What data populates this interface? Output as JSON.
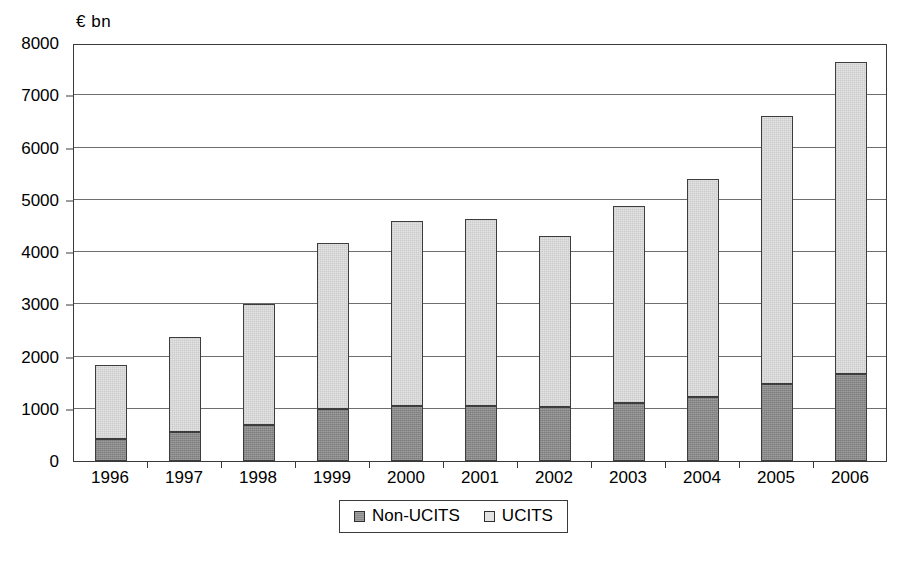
{
  "chart_data": {
    "type": "bar",
    "stacked": true,
    "title": "",
    "subtitle": "",
    "xlabel": "",
    "ylabel": "€ bn",
    "unit_label": "€ bn",
    "categories": [
      "1996",
      "1997",
      "1998",
      "1999",
      "2000",
      "2001",
      "2002",
      "2003",
      "2004",
      "2005",
      "2006"
    ],
    "series": [
      {
        "name": "Non-UCITS",
        "color": "#8a8a8a",
        "values": [
          420,
          560,
          680,
          1000,
          1060,
          1050,
          1030,
          1110,
          1230,
          1470,
          1670
        ]
      },
      {
        "name": "UCITS",
        "color": "#e3e3e3",
        "values": [
          1410,
          1820,
          2330,
          3180,
          3540,
          3580,
          3280,
          3770,
          4170,
          5130,
          5960
        ]
      }
    ],
    "totals": [
      1830,
      2380,
      3010,
      4180,
      4600,
      4630,
      4310,
      4880,
      5400,
      6600,
      7630
    ],
    "ylim": [
      0,
      8000
    ],
    "ytick_values": [
      0,
      1000,
      2000,
      3000,
      4000,
      5000,
      6000,
      7000,
      8000
    ],
    "ytick_labels": [
      "0",
      "1000",
      "2000",
      "3000",
      "4000",
      "5000",
      "6000",
      "7000",
      "8000"
    ],
    "grid": true,
    "grid_axis": "y",
    "legend_position": "bottom",
    "legend_entries": [
      "Non-UCITS",
      "UCITS"
    ],
    "plot_border": true,
    "colors": {
      "non_ucits": "#8a8a8a",
      "ucits": "#e3e3e3",
      "axis": "#3a3a3a",
      "grid": "#6e6e6e",
      "background": "#ffffff"
    }
  }
}
